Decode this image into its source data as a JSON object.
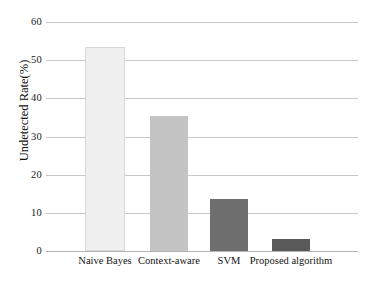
{
  "chart_data": {
    "type": "bar",
    "title": "",
    "subtitle": "",
    "xlabel": "",
    "ylabel": "Undetected Rate(%)",
    "categories": [
      "Naive Bayes",
      "Context-aware",
      "SVM",
      "Proposed algorithm"
    ],
    "values": [
      53.5,
      35.5,
      13.5,
      3.1
    ],
    "series": [
      {
        "name": "Undetected Rate",
        "values": [
          53.5,
          35.5,
          13.5,
          3.1
        ]
      }
    ],
    "ylim": [
      0,
      60
    ],
    "y_ticks": [
      0,
      10,
      20,
      30,
      40,
      50,
      60
    ],
    "y_tick_labels": [
      "0",
      "10",
      "20",
      "30",
      "40",
      "50",
      "60"
    ],
    "grid": true,
    "grid_axis": "y",
    "legend": false,
    "legend_position": "none",
    "bar_colors": [
      "#f0f0f0",
      "#c4c4c4",
      "#6e6e6e",
      "#5a5a5a"
    ],
    "bar_border_color": "#d8d8d8",
    "gridline_color": "#c8c8c8",
    "background_color": "#ffffff",
    "text_color": "#121212"
  }
}
